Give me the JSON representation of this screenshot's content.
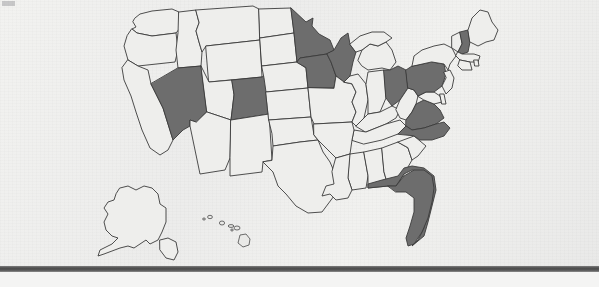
{
  "document": {
    "kind": "scanned-page",
    "title": "United States choropleth map",
    "caption": ""
  },
  "colors": {
    "page_background": "#efefed",
    "state_unshaded_fill": "#eeeeec",
    "state_shaded_fill": "#6d6d6d",
    "state_border": "#3b3b3b",
    "bottom_bar": "#4d4d4d"
  },
  "map": {
    "name": "united-states-map",
    "projection_note": "Contiguous US with Alaska and Hawaii insets at lower left",
    "legend": [],
    "insets": [
      {
        "name": "alaska-inset",
        "label": "",
        "shaded": false
      },
      {
        "name": "hawaii-inset",
        "label": "",
        "shaded": false
      }
    ],
    "shaded_states": [
      "Nevada",
      "Colorado",
      "Minnesota",
      "Wisconsin",
      "Iowa",
      "Ohio",
      "Pennsylvania",
      "New Hampshire",
      "Virginia",
      "North Carolina",
      "Florida"
    ],
    "unshaded_states": [
      "Washington",
      "Oregon",
      "California",
      "Idaho",
      "Montana",
      "Wyoming",
      "Utah",
      "Arizona",
      "New Mexico",
      "North Dakota",
      "South Dakota",
      "Nebraska",
      "Kansas",
      "Oklahoma",
      "Texas",
      "Missouri",
      "Arkansas",
      "Louisiana",
      "Mississippi",
      "Alabama",
      "Georgia",
      "South Carolina",
      "Tennessee",
      "Kentucky",
      "Illinois",
      "Indiana",
      "Michigan",
      "West Virginia",
      "Maryland",
      "Delaware",
      "New Jersey",
      "New York",
      "Connecticut",
      "Rhode Island",
      "Massachusetts",
      "Vermont",
      "Maine",
      "Alaska",
      "Hawaii"
    ],
    "shaded_count": 11
  },
  "footer": {
    "rule_label": "page-divider-rule"
  }
}
